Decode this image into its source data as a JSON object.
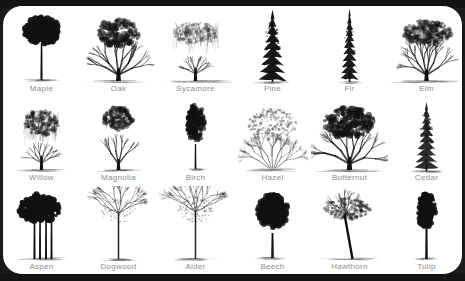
{
  "chart": {
    "type": "illustrated-reference-grid",
    "columns": 6,
    "rows": 3,
    "label_color": "#8c8c8c",
    "ink_color": "#111111",
    "card_background": "#ffffff",
    "frame_color": "#141414"
  },
  "trees": [
    {
      "label": "Maple",
      "icon": "maple-tree-icon",
      "tone": "solid-dark",
      "shape": "broad-rounded-dense",
      "row": 1,
      "col": 1
    },
    {
      "label": "Oak",
      "icon": "oak-tree-icon",
      "tone": "medium",
      "shape": "broad-spreading",
      "row": 1,
      "col": 2
    },
    {
      "label": "Sycamore",
      "icon": "sycamore-tree-icon",
      "tone": "light-sketch",
      "shape": "wide-weeping-canopy",
      "row": 1,
      "col": 3
    },
    {
      "label": "Pine",
      "icon": "pine-tree-icon",
      "tone": "solid-dark",
      "shape": "conical-evergreen",
      "row": 1,
      "col": 4
    },
    {
      "label": "Fir",
      "icon": "fir-tree-icon",
      "tone": "solid-dark",
      "shape": "narrow-conical",
      "row": 1,
      "col": 5
    },
    {
      "label": "Elm",
      "icon": "elm-tree-icon",
      "tone": "medium",
      "shape": "vase-wide-crown",
      "row": 1,
      "col": 6
    },
    {
      "label": "Willow",
      "icon": "willow-tree-icon",
      "tone": "medium-dark",
      "shape": "weeping-drooping",
      "row": 2,
      "col": 1
    },
    {
      "label": "Magnolia",
      "icon": "magnolia-tree-icon",
      "tone": "medium",
      "shape": "rounded-open-crown",
      "row": 2,
      "col": 2
    },
    {
      "label": "Birch",
      "icon": "birch-tree-icon",
      "tone": "medium-dark",
      "shape": "narrow-upright",
      "row": 2,
      "col": 3
    },
    {
      "label": "Hazel",
      "icon": "hazel-tree-icon",
      "tone": "light-medium",
      "shape": "bushy-multi-stem",
      "row": 2,
      "col": 4
    },
    {
      "label": "Butternut",
      "icon": "butternut-tree-icon",
      "tone": "dark",
      "shape": "broad-spreading-dense",
      "row": 2,
      "col": 5
    },
    {
      "label": "Cedar",
      "icon": "cedar-tree-icon",
      "tone": "dark",
      "shape": "conical-evergreen",
      "row": 2,
      "col": 6
    },
    {
      "label": "Aspen",
      "icon": "aspen-tree-icon",
      "tone": "solid-dark",
      "shape": "clustered-multi-trunk",
      "row": 3,
      "col": 1
    },
    {
      "label": "Dogwood",
      "icon": "dogwood-tree-icon",
      "tone": "light-sketch",
      "shape": "open-branching-bare",
      "row": 3,
      "col": 2
    },
    {
      "label": "Alder",
      "icon": "alder-tree-icon",
      "tone": "light-medium",
      "shape": "tall-open-crown",
      "row": 3,
      "col": 3
    },
    {
      "label": "Beech",
      "icon": "beech-tree-icon",
      "tone": "solid-dark",
      "shape": "tall-oval-dense",
      "row": 3,
      "col": 4
    },
    {
      "label": "Hawthorn",
      "icon": "hawthorn-tree-icon",
      "tone": "medium",
      "shape": "leaning-flat-crown",
      "row": 3,
      "col": 5
    },
    {
      "label": "Tulip",
      "icon": "tulip-tree-icon",
      "tone": "solid-dark",
      "shape": "narrow-columnar",
      "row": 3,
      "col": 6
    }
  ]
}
